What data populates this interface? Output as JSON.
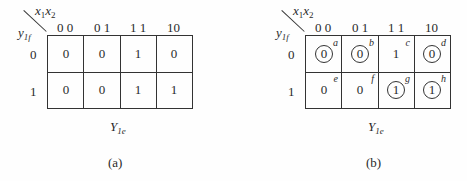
{
  "maps": [
    {
      "id": "a",
      "col_var": [
        "x",
        "1",
        "x",
        "2"
      ],
      "row_var": [
        "y",
        "1f"
      ],
      "col_headers": [
        "0 0",
        "0 1",
        "1 1",
        "10"
      ],
      "row_headers": [
        "0",
        "1"
      ],
      "cells": [
        [
          "0",
          "0",
          "1",
          "0"
        ],
        [
          "0",
          "0",
          "1",
          "1"
        ]
      ],
      "circled": [
        [
          false,
          false,
          false,
          false
        ],
        [
          false,
          false,
          false,
          false
        ]
      ],
      "corner_labels": [
        [
          "",
          "",
          "",
          ""
        ],
        [
          "",
          "",
          "",
          ""
        ]
      ],
      "output": [
        "Y",
        "1e"
      ],
      "caption": "(a)"
    },
    {
      "id": "b",
      "col_var": [
        "x",
        "1",
        "x",
        "2"
      ],
      "row_var": [
        "y",
        "1f"
      ],
      "col_headers": [
        "0 0",
        "0 1",
        "1 1",
        "10"
      ],
      "row_headers": [
        "0",
        "1"
      ],
      "cells": [
        [
          "0",
          "0",
          "1",
          "0"
        ],
        [
          "0",
          "0",
          "1",
          "1"
        ]
      ],
      "circled": [
        [
          true,
          true,
          false,
          true
        ],
        [
          false,
          false,
          true,
          true
        ]
      ],
      "corner_labels": [
        [
          "a",
          "b",
          "c",
          "d"
        ],
        [
          "e",
          "f",
          "g",
          "h"
        ]
      ],
      "output": [
        "Y",
        "1e"
      ],
      "caption": "(b)"
    }
  ]
}
